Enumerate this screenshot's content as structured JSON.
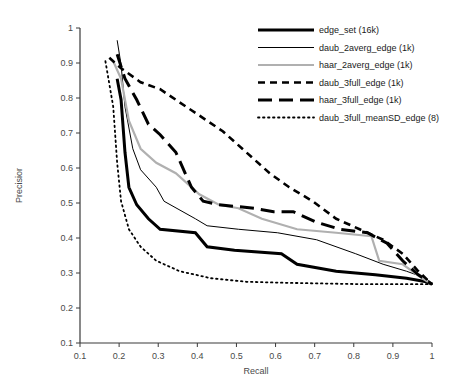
{
  "chart_data": {
    "type": "line",
    "title": "",
    "xlabel": "Recall",
    "ylabel": "Precisior",
    "xlim": [
      0.1,
      1.0
    ],
    "ylim": [
      0.1,
      1.0
    ],
    "xticks": [
      "0.1",
      "0.2",
      "0.3",
      "0.4",
      "0.5",
      "0.6",
      "0.7",
      "0.8",
      "0.9",
      "1"
    ],
    "yticks": [
      "0.1",
      "0.2",
      "0.3",
      "0.4",
      "0.5",
      "0.6",
      "0.7",
      "0.8",
      "0.9",
      "1"
    ],
    "grid": false,
    "legend_position": "top-right",
    "series": [
      {
        "name": "edge_set (16k)",
        "style": "solid-thick",
        "color": "#000000",
        "width": 3.0,
        "dash": "",
        "points": [
          [
            0.195,
            0.855
          ],
          [
            0.205,
            0.795
          ],
          [
            0.215,
            0.645
          ],
          [
            0.225,
            0.545
          ],
          [
            0.245,
            0.495
          ],
          [
            0.275,
            0.455
          ],
          [
            0.305,
            0.425
          ],
          [
            0.395,
            0.415
          ],
          [
            0.425,
            0.375
          ],
          [
            0.495,
            0.365
          ],
          [
            0.615,
            0.355
          ],
          [
            0.655,
            0.325
          ],
          [
            0.755,
            0.305
          ],
          [
            0.855,
            0.295
          ],
          [
            0.935,
            0.285
          ],
          [
            0.985,
            0.275
          ],
          [
            1.0,
            0.268
          ]
        ]
      },
      {
        "name": "daub_2averg_edge (1k)",
        "style": "solid-thin",
        "color": "#000000",
        "width": 1.0,
        "dash": "",
        "points": [
          [
            0.195,
            0.965
          ],
          [
            0.205,
            0.895
          ],
          [
            0.215,
            0.775
          ],
          [
            0.235,
            0.655
          ],
          [
            0.255,
            0.595
          ],
          [
            0.295,
            0.545
          ],
          [
            0.315,
            0.505
          ],
          [
            0.395,
            0.455
          ],
          [
            0.425,
            0.435
          ],
          [
            0.505,
            0.425
          ],
          [
            0.605,
            0.415
          ],
          [
            0.705,
            0.395
          ],
          [
            0.805,
            0.355
          ],
          [
            0.875,
            0.325
          ],
          [
            0.935,
            0.305
          ],
          [
            0.985,
            0.285
          ],
          [
            1.0,
            0.268
          ]
        ]
      },
      {
        "name": "haar_2averg_edge (1k)",
        "style": "solid-grey",
        "color": "#b0b0b0",
        "width": 2.2,
        "dash": "",
        "points": [
          [
            0.185,
            0.905
          ],
          [
            0.205,
            0.855
          ],
          [
            0.225,
            0.735
          ],
          [
            0.255,
            0.655
          ],
          [
            0.295,
            0.615
          ],
          [
            0.345,
            0.585
          ],
          [
            0.405,
            0.525
          ],
          [
            0.455,
            0.495
          ],
          [
            0.505,
            0.485
          ],
          [
            0.565,
            0.455
          ],
          [
            0.655,
            0.425
          ],
          [
            0.755,
            0.415
          ],
          [
            0.845,
            0.405
          ],
          [
            0.865,
            0.335
          ],
          [
            0.925,
            0.325
          ],
          [
            0.975,
            0.285
          ],
          [
            1.0,
            0.268
          ]
        ]
      },
      {
        "name": "daub_3full_edge (1k)",
        "style": "dashed-sq",
        "color": "#000000",
        "width": 2.6,
        "dash": "7,5",
        "points": [
          [
            0.175,
            0.915
          ],
          [
            0.205,
            0.885
          ],
          [
            0.255,
            0.845
          ],
          [
            0.305,
            0.825
          ],
          [
            0.385,
            0.765
          ],
          [
            0.465,
            0.705
          ],
          [
            0.525,
            0.645
          ],
          [
            0.585,
            0.585
          ],
          [
            0.635,
            0.545
          ],
          [
            0.695,
            0.505
          ],
          [
            0.755,
            0.455
          ],
          [
            0.815,
            0.425
          ],
          [
            0.875,
            0.395
          ],
          [
            0.925,
            0.355
          ],
          [
            0.965,
            0.305
          ],
          [
            1.0,
            0.268
          ]
        ]
      },
      {
        "name": "haar_3full_edge (1k)",
        "style": "dashed-long",
        "color": "#000000",
        "width": 3.0,
        "dash": "14,7",
        "points": [
          [
            0.195,
            0.925
          ],
          [
            0.215,
            0.855
          ],
          [
            0.245,
            0.795
          ],
          [
            0.275,
            0.725
          ],
          [
            0.305,
            0.695
          ],
          [
            0.345,
            0.645
          ],
          [
            0.385,
            0.545
          ],
          [
            0.415,
            0.505
          ],
          [
            0.455,
            0.495
          ],
          [
            0.545,
            0.485
          ],
          [
            0.595,
            0.475
          ],
          [
            0.645,
            0.475
          ],
          [
            0.705,
            0.445
          ],
          [
            0.765,
            0.425
          ],
          [
            0.835,
            0.415
          ],
          [
            0.885,
            0.385
          ],
          [
            0.925,
            0.335
          ],
          [
            0.965,
            0.295
          ],
          [
            1.0,
            0.268
          ]
        ]
      },
      {
        "name": "daub_3full_meanSD_edge (8)",
        "style": "dotted",
        "color": "#000000",
        "width": 1.8,
        "dash": "1.5,3.5",
        "points": [
          [
            0.165,
            0.905
          ],
          [
            0.185,
            0.775
          ],
          [
            0.195,
            0.615
          ],
          [
            0.205,
            0.505
          ],
          [
            0.225,
            0.425
          ],
          [
            0.255,
            0.375
          ],
          [
            0.295,
            0.335
          ],
          [
            0.355,
            0.305
          ],
          [
            0.435,
            0.285
          ],
          [
            0.525,
            0.275
          ],
          [
            0.625,
            0.272
          ],
          [
            0.725,
            0.27
          ],
          [
            0.825,
            0.268
          ],
          [
            0.925,
            0.268
          ],
          [
            1.0,
            0.268
          ]
        ]
      }
    ]
  },
  "legend": {
    "items": [
      {
        "label": "edge_set (16k)"
      },
      {
        "label": "daub_2averg_edge (1k)"
      },
      {
        "label": "haar_2averg_edge (1k)"
      },
      {
        "label": "daub_3full_edge (1k)"
      },
      {
        "label": "haar_3full_edge (1k)"
      },
      {
        "label": "daub_3full_meanSD_edge (8)"
      }
    ]
  }
}
